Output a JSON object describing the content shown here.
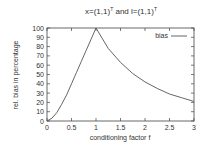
{
  "chart_data": {
    "type": "line",
    "xlabel": "conditioning factor f",
    "ylabel": "rel. bias in percentage",
    "xlim": [
      0,
      3
    ],
    "ylim": [
      0,
      100
    ],
    "xticks": [
      "0",
      "0.5",
      "1",
      "1.5",
      "2",
      "2.5",
      "3"
    ],
    "yticks": [
      "0",
      "10",
      "20",
      "30",
      "40",
      "50",
      "60",
      "70",
      "80",
      "90",
      "100"
    ],
    "legend": {
      "position": "top-right",
      "entries": [
        "bias"
      ]
    },
    "grid": false,
    "series": [
      {
        "name": "bias",
        "x": [
          0,
          0.1,
          0.2,
          0.3,
          0.4,
          0.5,
          0.6,
          0.7,
          0.8,
          0.9,
          1.0,
          1.25,
          1.5,
          1.75,
          2.0,
          2.25,
          2.5,
          2.75,
          3.0
        ],
        "values": [
          0,
          3,
          9,
          18,
          28,
          40,
          52,
          64,
          76,
          88,
          100,
          78,
          63,
          51,
          42,
          35,
          29,
          25,
          21
        ]
      }
    ]
  }
}
